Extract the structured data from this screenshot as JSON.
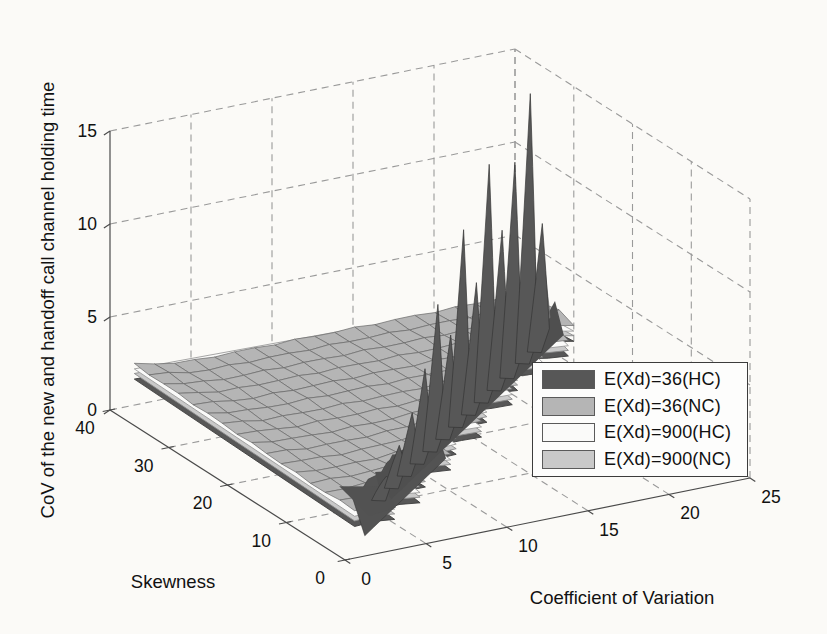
{
  "chart_data": {
    "type": "surface3d",
    "title": "",
    "xlabel": "Coefficient of Variation",
    "ylabel": "Skewness",
    "zlabel": "CoV of the new and handoff call channel holding time",
    "x_ticks": [
      0,
      5,
      10,
      15,
      20,
      25
    ],
    "y_ticks": [
      0,
      10,
      20,
      30,
      40
    ],
    "z_ticks": [
      0,
      5,
      10,
      15
    ],
    "xlim": [
      0,
      25
    ],
    "ylim": [
      0,
      40
    ],
    "zlim": [
      0,
      15
    ],
    "grid": "dashed",
    "view": {
      "azimuth": -37.5,
      "elevation": 30
    },
    "colors": {
      "hc36": "#575757",
      "nc36": "#b5b5b5",
      "hc900": "#fafaf9",
      "nc900": "#c9c9c9",
      "mesh_edge": "#696969",
      "grid_line": "#9a9a9a",
      "axis_line": "#4a4a4a"
    },
    "legend": {
      "position": "right-middle",
      "entries": [
        {
          "label": "E(Xd)=36(HC)",
          "color": "#575757"
        },
        {
          "label": "E(Xd)=36(NC)",
          "color": "#b5b5b5"
        },
        {
          "label": "E(Xd)=900(HC)",
          "color": "#fafaf9"
        },
        {
          "label": "E(Xd)=900(NC)",
          "color": "#c9c9c9"
        }
      ]
    },
    "domain": {
      "cv_min": 1.5,
      "cv_max": 25,
      "sk_min_slope": 1.3,
      "sk_min_intercept": 0.4,
      "sk_max": 40,
      "cv_cells": 19,
      "sk_cells": 16
    },
    "surfaces": [
      {
        "name": "E(Xd)=36(HC)",
        "role": "dark-spiky",
        "base_z": 0.95,
        "spikes": [
          {
            "cv": 5.0,
            "peak": 2.2
          },
          {
            "cv": 6.5,
            "peak": 3.2
          },
          {
            "cv": 8.0,
            "peak": 4.3
          },
          {
            "cv": 9.5,
            "peak": 6.0
          },
          {
            "cv": 11.0,
            "peak": 8.8
          },
          {
            "cv": 12.5,
            "peak": 6.5
          },
          {
            "cv": 14.0,
            "peak": 11.5
          },
          {
            "cv": 15.5,
            "peak": 8.0
          },
          {
            "cv": 17.0,
            "peak": 13.7
          },
          {
            "cv": 18.5,
            "peak": 9.5
          },
          {
            "cv": 20.0,
            "peak": 12.5
          },
          {
            "cv": 21.8,
            "peak": 15.4
          },
          {
            "cv": 23.2,
            "peak": 7.8
          }
        ]
      },
      {
        "name": "E(Xd)=36(NC)",
        "role": "top-mesh",
        "base_z": 1.75
      },
      {
        "name": "E(Xd)=900(HC)",
        "role": "sheet-white",
        "base_z": 1.45
      },
      {
        "name": "E(Xd)=900(NC)",
        "role": "sheet-gray",
        "base_z": 1.2
      }
    ]
  }
}
